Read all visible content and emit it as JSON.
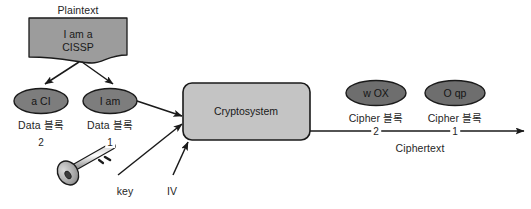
{
  "diagram": {
    "title_label": "Plaintext",
    "plaintext_box": {
      "text": "I am a\nCISSP",
      "fill": "#9c9c9c"
    },
    "data_blocks": [
      {
        "ellipse_text": "a CI",
        "caption": "Data 블록",
        "number": "2",
        "fill": "#7d7d7d"
      },
      {
        "ellipse_text": "I am",
        "caption": "Data 블록",
        "number": "1",
        "fill": "#7d7d7d"
      }
    ],
    "cryptosystem": {
      "label": "Cryptosystem",
      "fill": "#c4c4c4"
    },
    "inputs": [
      {
        "label": "key",
        "name": "key"
      },
      {
        "label": "IV",
        "name": "iv"
      }
    ],
    "cipher_blocks": [
      {
        "ellipse_text": "w OX",
        "caption": "Cipher 블록",
        "number": "2",
        "fill": "#6e6e6e"
      },
      {
        "ellipse_text": "O qp",
        "caption": "Cipher 블록",
        "number": "1",
        "fill": "#6e6e6e"
      }
    ],
    "ciphertext_label": "Ciphertext",
    "bottom_fragment": "",
    "colors": {
      "stroke": "#1a1a1a",
      "text": "#262626",
      "background": "#ffffff",
      "key_fill": "#b4b4b4"
    }
  }
}
